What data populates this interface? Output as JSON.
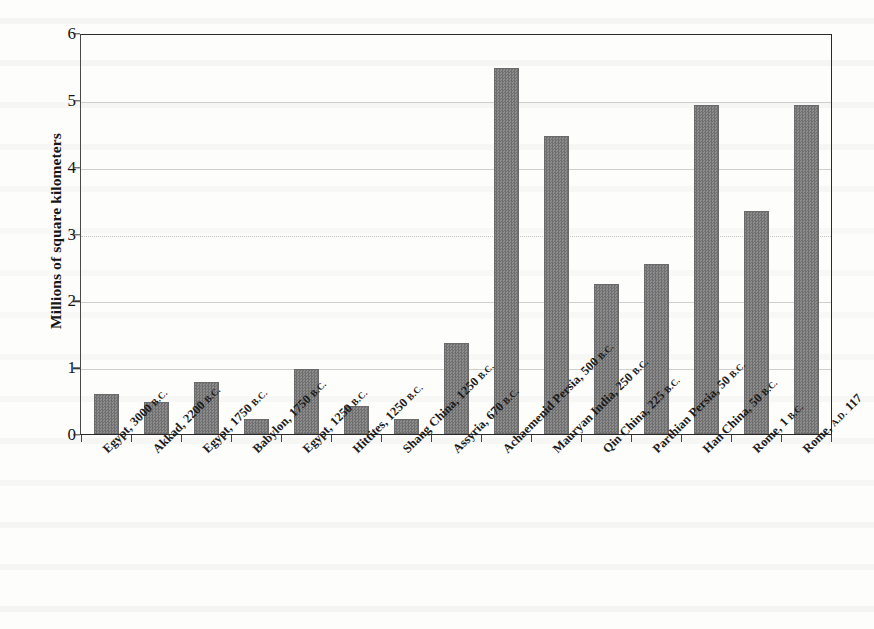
{
  "chart_data": {
    "type": "bar",
    "title": "",
    "xlabel": "",
    "ylabel": "Millions of square kilometers",
    "ylim": [
      0,
      6
    ],
    "yticks": [
      0,
      1,
      2,
      3,
      4,
      5,
      6
    ],
    "ytick_labels": [
      "0",
      "1",
      "2",
      "3",
      "4",
      "5",
      "6"
    ],
    "grid": true,
    "legend": "none",
    "bar_color": "#7e7e7e",
    "categories": [
      "Egypt, 3000 B.C.",
      "Akkad, 2200 B.C.",
      "Egypt, 1750 B.C.",
      "Babylon, 1750 B.C.",
      "Egypt, 1250 B.C.",
      "Hittites, 1250 B.C.",
      "Shang China, 1250 B.C.",
      "Assyria, 670 B.C.",
      "Achaemenid Persia, 500 B.C.",
      "Mauryan India, 250 B.C.",
      "Qin China, 225 B.C.",
      "Parthian Persia, 50 B.C.",
      "Han China, 50 B.C.",
      "Rome, 1 B.C.",
      "Rome, A.D. 117"
    ],
    "category_parts": [
      {
        "name": "Egypt, 3000",
        "era": "B.C."
      },
      {
        "name": "Akkad, 2200",
        "era": "B.C."
      },
      {
        "name": "Egypt, 1750",
        "era": "B.C."
      },
      {
        "name": "Babylon, 1750",
        "era": "B.C."
      },
      {
        "name": "Egypt, 1250",
        "era": "B.C."
      },
      {
        "name": "Hittites, 1250",
        "era": "B.C."
      },
      {
        "name": "Shang China, 1250",
        "era": "B.C."
      },
      {
        "name": "Assyria, 670",
        "era": "B.C."
      },
      {
        "name": "Achaemenid Persia, 500",
        "era": "B.C."
      },
      {
        "name": "Mauryan India, 250",
        "era": "B.C."
      },
      {
        "name": "Qin China, 225",
        "era": "B.C."
      },
      {
        "name": "Parthian Persia, 50",
        "era": "B.C."
      },
      {
        "name": "Han China, 50",
        "era": "B.C."
      },
      {
        "name": "Rome, 1",
        "era": "B.C."
      },
      {
        "name": "Rome,",
        "era": "A.D.",
        "suffix": " 117"
      }
    ],
    "values": [
      0.6,
      0.48,
      0.78,
      0.23,
      0.98,
      0.42,
      0.22,
      1.37,
      5.5,
      4.48,
      2.25,
      2.55,
      4.95,
      3.35,
      4.95
    ]
  }
}
